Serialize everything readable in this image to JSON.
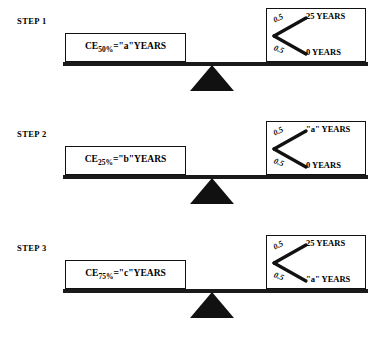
{
  "figure": {
    "colors": {
      "ink": "#111111",
      "background": "#ffffff"
    }
  },
  "steps": [
    {
      "label": "STEP 1",
      "certainty_equivalent": {
        "prefix": "CE",
        "subscript": "50%",
        "equals": "=\"a\"YEARS",
        "full_text": "CE50%=\"a\"YEARS"
      },
      "lottery": {
        "top": {
          "probability": "0.5",
          "outcome": "25 YEARS"
        },
        "bottom": {
          "probability": "0.5",
          "outcome": "0 YEARS"
        }
      }
    },
    {
      "label": "STEP 2",
      "certainty_equivalent": {
        "prefix": "CE",
        "subscript": "25%",
        "equals": "=\"b\"YEARS",
        "full_text": "CE25%=\"b\"YEARS"
      },
      "lottery": {
        "top": {
          "probability": "0.5",
          "outcome": "\"a\" YEARS"
        },
        "bottom": {
          "probability": "0.5",
          "outcome": "0 YEARS"
        }
      }
    },
    {
      "label": "STEP 3",
      "certainty_equivalent": {
        "prefix": "CE",
        "subscript": "75%",
        "equals": "=\"c\"YEARS",
        "full_text": "CE75%=\"c\"YEARS"
      },
      "lottery": {
        "top": {
          "probability": "0.5",
          "outcome": "25 YEARS"
        },
        "bottom": {
          "probability": "0.5",
          "outcome": "\"a\" YEARS"
        }
      }
    }
  ]
}
